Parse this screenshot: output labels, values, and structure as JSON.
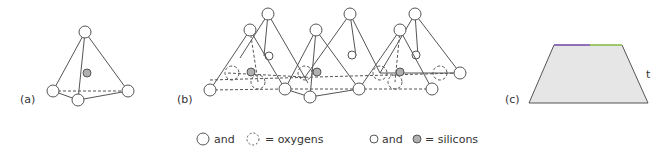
{
  "panels": {
    "a": {
      "label": "(a)"
    },
    "b": {
      "label": "(b)"
    },
    "c": {
      "label": "(c)",
      "side_label": "t"
    }
  },
  "legend": {
    "oxygens": {
      "and": "and",
      "text": "= oxygens"
    },
    "silicons": {
      "and": "and",
      "text": "= silicons"
    }
  },
  "colors": {
    "line": "#555555",
    "silicon_fill": "#b0b0b0",
    "trapezoid_fill": "#e6e6e6",
    "trapezoid_top_left": "#8a5fc0",
    "trapezoid_top_right": "#9cd45a"
  }
}
